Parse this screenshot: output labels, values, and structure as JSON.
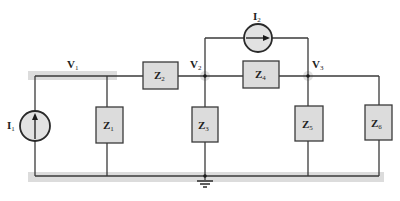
{
  "diagram": {
    "type": "nodal-analysis circuit",
    "header_fragment": "(Fig. 18.xx)",
    "nodes": [
      {
        "id": "V1",
        "label": "V",
        "sub": "1"
      },
      {
        "id": "V2",
        "label": "V",
        "sub": "2"
      },
      {
        "id": "V3",
        "label": "V",
        "sub": "3"
      }
    ],
    "sources": [
      {
        "id": "I1",
        "label": "I",
        "sub": "1",
        "direction": "up"
      },
      {
        "id": "I2",
        "label": "I",
        "sub": "2",
        "direction": "right"
      }
    ],
    "impedances": [
      {
        "id": "Z1",
        "label": "Z",
        "sub": "1"
      },
      {
        "id": "Z2",
        "label": "Z",
        "sub": "2"
      },
      {
        "id": "Z3",
        "label": "Z",
        "sub": "3"
      },
      {
        "id": "Z4",
        "label": "Z",
        "sub": "4"
      },
      {
        "id": "Z5",
        "label": "Z",
        "sub": "5"
      },
      {
        "id": "Z6",
        "label": "Z",
        "sub": "6"
      }
    ],
    "ground": {
      "icon": "ground-icon"
    },
    "colors": {
      "wire": "#3a3a3a",
      "box_fill": "#dcdcdc",
      "highlight_band": "#dcdcdc",
      "node_dot": "#1a1a1a"
    }
  }
}
